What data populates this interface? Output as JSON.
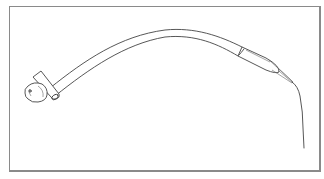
{
  "figure": {
    "parts": [
      "clip",
      "hub",
      "tube",
      "sleeve",
      "tip",
      "wire"
    ],
    "colors": {
      "line": "#444444",
      "frame": "#8a8a8a",
      "background": "#ffffff"
    }
  }
}
